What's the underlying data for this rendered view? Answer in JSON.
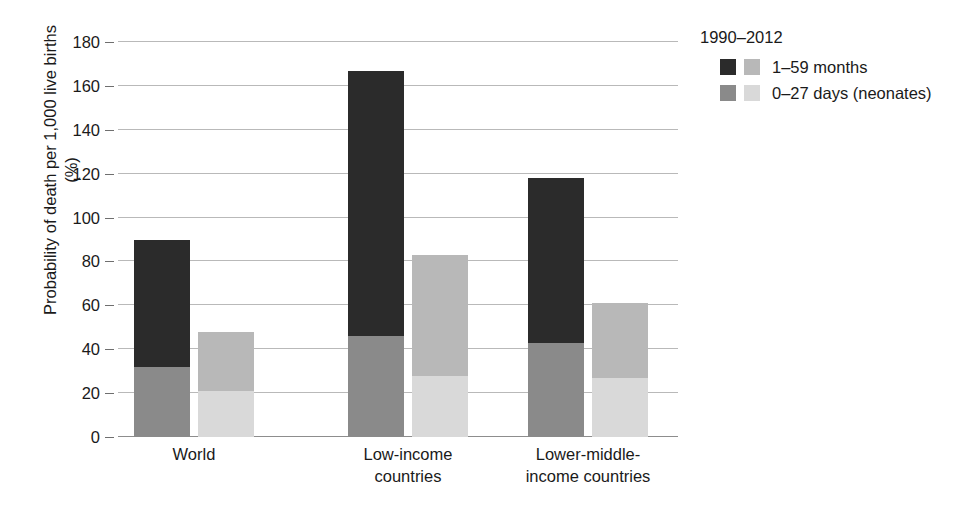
{
  "chart_data": {
    "type": "bar",
    "title": "",
    "subtitle": "",
    "xlabel": "",
    "ylabel": "Probability of death per 1,000 live births (%)",
    "ylim": [
      0,
      180
    ],
    "yticks": [
      0,
      20,
      40,
      60,
      80,
      100,
      120,
      140,
      160,
      180
    ],
    "ytick_labels": [
      "0",
      "20",
      "40",
      "60",
      "80",
      "100",
      "120",
      "140",
      "160",
      "180"
    ],
    "grid": true,
    "stacked": true,
    "legend_position": "top-right",
    "legend_title": "1990–2012",
    "categories": [
      "World",
      "Low-income countries",
      "Lower-middle-income countries"
    ],
    "category_label_lines": [
      [
        "World"
      ],
      [
        "Low-income",
        "countries"
      ],
      [
        "Lower-middle-",
        "income countries"
      ]
    ],
    "year_groups": [
      "1990",
      "2012"
    ],
    "age_groups": [
      "1–59 months",
      "0–27 days (neonates)"
    ],
    "series": [
      {
        "name": "1990 — 1–59 months",
        "year": "1990",
        "age_group": "1–59 months",
        "color": "#2b2b2b",
        "values": [
          58,
          121,
          75
        ]
      },
      {
        "name": "1990 — 0–27 days (neonates)",
        "year": "1990",
        "age_group": "0–27 days (neonates)",
        "color": "#8a8a8a",
        "values": [
          32,
          46,
          43
        ]
      },
      {
        "name": "2012 — 1–59 months",
        "year": "2012",
        "age_group": "1–59 months",
        "color": "#b8b8b8",
        "values": [
          27,
          55,
          34
        ]
      },
      {
        "name": "2012 — 0–27 days (neonates)",
        "year": "2012",
        "age_group": "0–27 days (neonates)",
        "color": "#d9d9d9",
        "values": [
          21,
          28,
          27
        ]
      }
    ],
    "bars": [
      {
        "category": "World",
        "year": "1990",
        "total": 90,
        "neonatal": 32,
        "postneonatal": 58
      },
      {
        "category": "World",
        "year": "2012",
        "total": 48,
        "neonatal": 21,
        "postneonatal": 27
      },
      {
        "category": "Low-income countries",
        "year": "1990",
        "total": 167,
        "neonatal": 46,
        "postneonatal": 121
      },
      {
        "category": "Low-income countries",
        "year": "2012",
        "total": 83,
        "neonatal": 28,
        "postneonatal": 55
      },
      {
        "category": "Lower-middle-income countries",
        "year": "1990",
        "total": 118,
        "neonatal": 43,
        "postneonatal": 75
      },
      {
        "category": "Lower-middle-income countries",
        "year": "2012",
        "total": 61,
        "neonatal": 27,
        "postneonatal": 34
      }
    ]
  },
  "legend": {
    "title": "1990–2012",
    "rows": [
      {
        "label": "1–59 months",
        "swatch_dark": "#2b2b2b",
        "swatch_light": "#b8b8b8"
      },
      {
        "label": "0–27 days (neonates)",
        "swatch_dark": "#8a8a8a",
        "swatch_light": "#d9d9d9"
      }
    ]
  },
  "axis": {
    "y_title": "Probability of death per 1,000 live births (%)"
  },
  "colors": {
    "dark_1990_postneonatal": "#2b2b2b",
    "mid_1990_neonatal": "#8a8a8a",
    "light_2012_postneonatal": "#b8b8b8",
    "lightest_2012_neonatal": "#d9d9d9",
    "gridline": "#b9b9b9",
    "axis": "#8d8d8d",
    "text": "#1a1a1a",
    "background": "#ffffff"
  }
}
